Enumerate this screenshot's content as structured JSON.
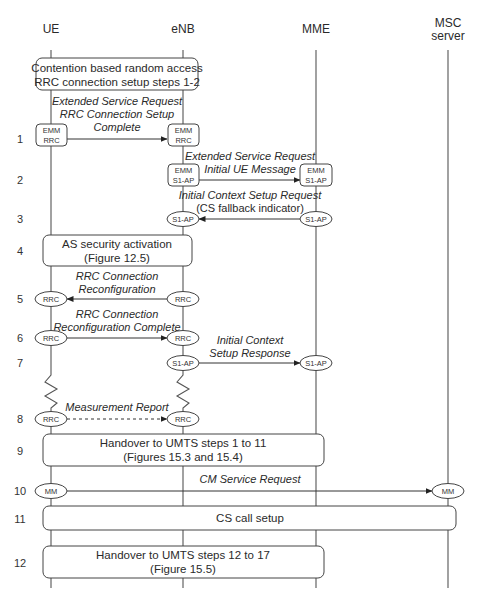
{
  "diagram": {
    "accent_color": "#333333",
    "entities": [
      {
        "id": "ue",
        "label_lines": [
          "UE"
        ],
        "x": 51
      },
      {
        "id": "enb",
        "label_lines": [
          "eNB"
        ],
        "x": 183
      },
      {
        "id": "mme",
        "label_lines": [
          "MME"
        ],
        "x": 316
      },
      {
        "id": "msc",
        "label_lines": [
          "MSC",
          "server"
        ],
        "x": 448
      }
    ],
    "step_numbers": [
      {
        "n": "1",
        "y": 139
      },
      {
        "n": "2",
        "y": 180
      },
      {
        "n": "3",
        "y": 219
      },
      {
        "n": "4",
        "y": 251
      },
      {
        "n": "5",
        "y": 299
      },
      {
        "n": "6",
        "y": 338
      },
      {
        "n": "7",
        "y": 363
      },
      {
        "n": "8",
        "y": 419
      },
      {
        "n": "9",
        "y": 451
      },
      {
        "n": "10",
        "y": 491
      },
      {
        "n": "11",
        "y": 519
      },
      {
        "n": "12",
        "y": 563
      }
    ],
    "process_boxes": [
      {
        "id": "random-access",
        "x": 36,
        "y": 58,
        "w": 162,
        "h": 32,
        "lines": [
          "Contention based random access",
          "RRC connection setup steps 1-2"
        ]
      },
      {
        "id": "as-security",
        "x": 43,
        "y": 235,
        "w": 149,
        "h": 31,
        "lines": [
          "AS security activation",
          "(Figure 12.5)"
        ]
      },
      {
        "id": "handover-1-11",
        "x": 43,
        "y": 434,
        "w": 281,
        "h": 32,
        "lines": [
          "Handover to UMTS steps 1 to 11",
          "(Figures 15.3 and 15.4)"
        ]
      },
      {
        "id": "cs-call-setup",
        "x": 43,
        "y": 506,
        "w": 413,
        "h": 24,
        "lines": [
          "CS call setup"
        ]
      },
      {
        "id": "handover-12-17",
        "x": 43,
        "y": 546,
        "w": 281,
        "h": 32,
        "lines": [
          "Handover to UMTS steps 12 to 17",
          "(Figure 15.5)"
        ]
      }
    ],
    "messages": [
      {
        "step": "1",
        "from": "ue",
        "to": "enb",
        "y": 139,
        "style": "solid",
        "shape": "rect",
        "from_proto": [
          "EMM",
          "RRC"
        ],
        "to_proto": [
          "EMM",
          "RRC"
        ],
        "label_lines": [
          "Extended Service Request",
          "RRC Connection Setup",
          "Complete"
        ],
        "label_y": 104
      },
      {
        "step": "2",
        "from": "enb",
        "to": "mme",
        "y": 180,
        "style": "solid",
        "shape": "rect",
        "from_proto": [
          "EMM",
          "S1-AP"
        ],
        "to_proto": [
          "EMM",
          "S1-AP"
        ],
        "label_lines": [
          "Extended Service Request",
          "Initial UE Message"
        ],
        "label_y": 159
      },
      {
        "step": "3",
        "from": "mme",
        "to": "enb",
        "y": 219,
        "style": "solid",
        "shape": "ellipse",
        "from_proto": [
          "S1-AP"
        ],
        "to_proto": [
          "S1-AP"
        ],
        "label_lines": [
          "Initial Context Setup Request",
          "(CS fallback indicator)"
        ],
        "label_y": 198,
        "plain_last_line": true
      },
      {
        "step": "5",
        "from": "enb",
        "to": "ue",
        "y": 299,
        "style": "solid",
        "shape": "ellipse",
        "from_proto": [
          "RRC"
        ],
        "to_proto": [
          "RRC"
        ],
        "label_lines": [
          "RRC Connection",
          "Reconfiguration"
        ],
        "label_y": 277
      },
      {
        "step": "6",
        "from": "ue",
        "to": "enb",
        "y": 338,
        "style": "solid",
        "shape": "ellipse",
        "from_proto": [
          "RRC"
        ],
        "to_proto": [
          "RRC"
        ],
        "label_lines": [
          "RRC Connection",
          "Reconfiguration Complete"
        ],
        "label_y": 316
      },
      {
        "step": "7",
        "from": "enb",
        "to": "mme",
        "y": 363,
        "style": "solid",
        "shape": "ellipse",
        "from_proto": [
          "S1-AP"
        ],
        "to_proto": [
          "S1-AP"
        ],
        "label_lines": [
          "Initial Context",
          "Setup Response"
        ],
        "label_y": 341
      },
      {
        "step": "8",
        "from": "ue",
        "to": "enb",
        "y": 419,
        "style": "dashed",
        "shape": "ellipse",
        "from_proto": [
          "RRC"
        ],
        "to_proto": [
          "RRC"
        ],
        "label_lines": [
          "Measurement Report"
        ],
        "label_y": 410
      },
      {
        "step": "10",
        "from": "ue",
        "to": "msc",
        "y": 491,
        "style": "solid",
        "shape": "ellipse",
        "from_proto": [
          "MM"
        ],
        "to_proto": [
          "MM"
        ],
        "label_lines": [
          "CM Service Request"
        ],
        "label_y": 482
      }
    ]
  }
}
